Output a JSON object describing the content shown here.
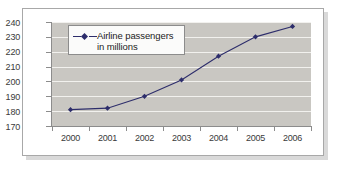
{
  "chart_data": {
    "type": "line",
    "title": "",
    "xlabel": "",
    "ylabel": "",
    "categories": [
      "2000",
      "2001",
      "2002",
      "2003",
      "2004",
      "2005",
      "2006"
    ],
    "series": [
      {
        "name": "Airline passengers in millions",
        "values": [
          181,
          182,
          190,
          201,
          217,
          230,
          237
        ],
        "color": "#2d2d6b",
        "marker": "diamond"
      }
    ],
    "ylim": [
      170,
      240
    ],
    "ytick_labels": [
      "240",
      "230",
      "220",
      "210",
      "200",
      "190",
      "180",
      "170"
    ],
    "ytick_values": [
      240,
      230,
      220,
      210,
      200,
      190,
      180,
      170
    ],
    "grid": "horizontal",
    "legend_position": "top-left",
    "plot_background": "#c9c7c2",
    "gridline_color": "#f2f1ee",
    "axis_color": "#8c8c8c"
  },
  "legend": {
    "line1": "Airline passengers",
    "line2": "in millions"
  }
}
